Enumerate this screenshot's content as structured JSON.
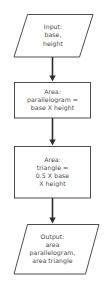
{
  "diagram": {
    "background_color": "#ffffff",
    "stroke_color": "#3a3a3a",
    "text_color": "#4a4a4a",
    "nodes": [
      {
        "id": "input",
        "shape": "parallelogram",
        "role": "input",
        "text": "Input:\nbase,\nheight"
      },
      {
        "id": "process-parallelogram",
        "shape": "rectangle",
        "role": "process",
        "text": "Area:\nparallelogram =\nbase X height"
      },
      {
        "id": "process-triangle",
        "shape": "rectangle",
        "role": "process",
        "text": "Area:\ntriangle =\n0.5 X base\nX height"
      },
      {
        "id": "output",
        "shape": "parallelogram",
        "role": "output",
        "text": "Output:\narea\nparallelogram,\narea triangle"
      }
    ],
    "connectors": [
      {
        "id": "arrow-1",
        "from": "input",
        "to": "process-parallelogram",
        "direction": "down"
      },
      {
        "id": "arrow-2",
        "from": "process-parallelogram",
        "to": "process-triangle",
        "direction": "down"
      },
      {
        "id": "arrow-3",
        "from": "process-triangle",
        "to": "output",
        "direction": "down"
      }
    ]
  }
}
